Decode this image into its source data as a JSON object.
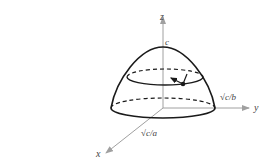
{
  "diagram": {
    "axes": {
      "x": {
        "label": "x",
        "intercept_label": "√c/a"
      },
      "y": {
        "label": "y",
        "intercept_label": "√c/b"
      },
      "z": {
        "label": "z",
        "intercept_label": "c"
      }
    },
    "colors": {
      "axis": "#a0a0a0",
      "curve": "#1a1a1a",
      "label": "#444444"
    }
  }
}
